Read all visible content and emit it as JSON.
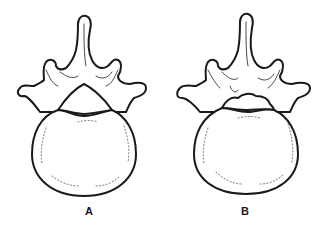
{
  "diagram": {
    "type": "anatomical line drawing",
    "figures": [
      {
        "id": "A",
        "label": "A",
        "description": "vertebra with smooth triangular vertebral foramen"
      },
      {
        "id": "B",
        "label": "B",
        "description": "vertebra with narrowed, irregular vertebral foramen"
      }
    ]
  },
  "colors": {
    "line": "#1a1a1a",
    "background": "#ffffff"
  }
}
